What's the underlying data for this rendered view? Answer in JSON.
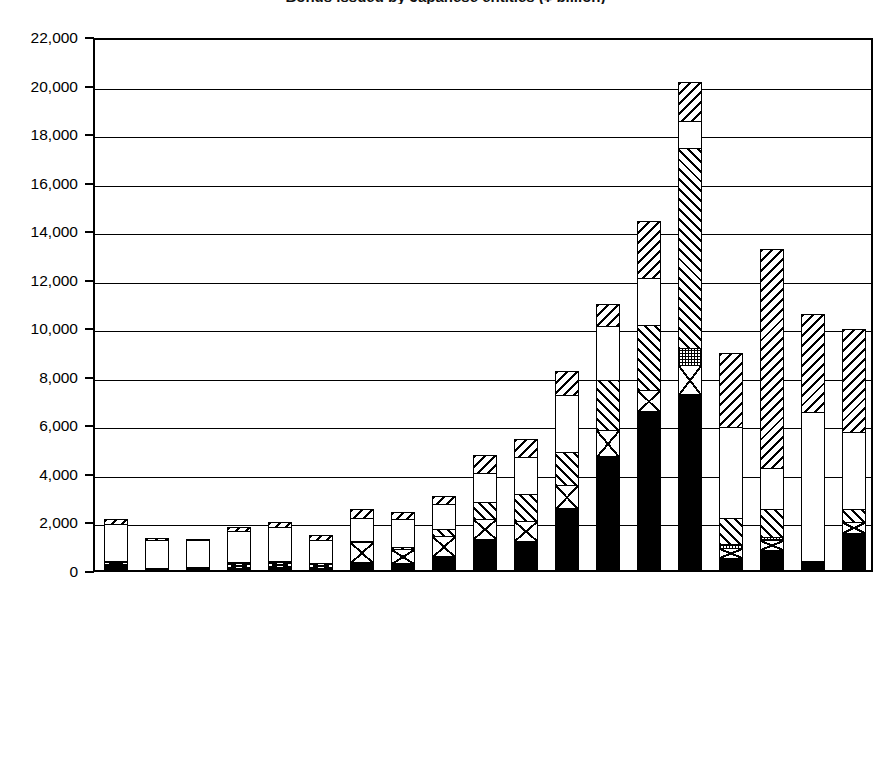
{
  "chart_title": "Bonds issued by Japanese entities (¥ billion)",
  "legend": {
    "left": [
      {
        "key": "straight_foreign",
        "label": "Straight bonds issued in foreign markets",
        "pattern": "p-straight-foreign"
      },
      {
        "key": "straight_domestic",
        "label": "Straight bonds issued in domestic market",
        "pattern": "p-straight-domestic"
      },
      {
        "key": "warrant_foreign",
        "label": "Warrant bonds issued in foreign markets",
        "pattern": "p-warrant-foreign"
      }
    ],
    "right": [
      {
        "key": "warrant_domestic",
        "label": "Warrant bonds issued in domestic market",
        "pattern": "p-warrant-domestic"
      },
      {
        "key": "convertible_foreign",
        "label": "Convertible bonds issued in foreign markets",
        "pattern": "p-convertible-foreign"
      },
      {
        "key": "convertible_domestic",
        "label": "Convertible bonds issued in domestic market",
        "pattern": "p-convertible-domestic"
      }
    ]
  },
  "chart_data": {
    "type": "bar",
    "stacked": true,
    "title": "Bonds issued by Japanese entities (¥ billion)",
    "xlabel": "",
    "ylabel": "",
    "ylim": [
      0,
      22000
    ],
    "ytick_step": 2000,
    "ytick_labels": [
      "0",
      "2,000",
      "4,000",
      "6,000",
      "8,000",
      "10,000",
      "12,000",
      "14,000",
      "16,000",
      "18,000",
      "20,000",
      "22,000"
    ],
    "grid": true,
    "legend_position": "below",
    "categories": [
      "75",
      "76",
      "77",
      "78",
      "79",
      "80",
      "81",
      "82",
      "83",
      "84",
      "85",
      "86",
      "87",
      "88",
      "89",
      "90",
      "91",
      "92",
      "93"
    ],
    "stack_order_bottom_to_top": [
      "convertible_domestic",
      "convertible_foreign",
      "warrant_domestic",
      "warrant_foreign",
      "straight_domestic",
      "straight_foreign"
    ],
    "series": [
      {
        "name": "Convertible bonds issued in domestic market",
        "key": "convertible_domestic",
        "values": [
          300,
          80,
          90,
          150,
          180,
          160,
          380,
          330,
          620,
          1350,
          1250,
          2600,
          4750,
          6600,
          7300,
          560,
          900,
          270,
          1600
        ]
      },
      {
        "name": "Convertible bonds issued in foreign markets",
        "key": "convertible_foreign",
        "values": [
          180,
          130,
          140,
          250,
          280,
          250,
          880,
          670,
          900,
          880,
          900,
          1000,
          1150,
          950,
          1250,
          450,
          450,
          180,
          500
        ]
      },
      {
        "name": "Warrant bonds issued in domestic market",
        "key": "warrant_domestic",
        "values": [
          0,
          0,
          0,
          0,
          0,
          0,
          0,
          0,
          0,
          0,
          0,
          0,
          0,
          0,
          750,
          220,
          180,
          0,
          0
        ]
      },
      {
        "name": "Warrant bonds issued in foreign markets",
        "key": "warrant_foreign",
        "values": [
          0,
          0,
          0,
          40,
          40,
          0,
          100,
          120,
          330,
          750,
          1150,
          1450,
          2100,
          2700,
          8300,
          1150,
          1200,
          100,
          600
        ]
      },
      {
        "name": "Straight bonds issued in domestic market",
        "key": "straight_domestic",
        "values": [
          1600,
          1180,
          1160,
          1350,
          1450,
          1000,
          1000,
          1200,
          1100,
          1250,
          1600,
          2400,
          2300,
          2000,
          1200,
          3800,
          1750,
          6200,
          3200
        ]
      },
      {
        "name": "Straight bonds issued in foreign markets",
        "key": "straight_foreign",
        "values": [
          250,
          150,
          130,
          230,
          270,
          250,
          450,
          350,
          400,
          800,
          800,
          1050,
          950,
          2400,
          1650,
          3100,
          9100,
          4100,
          4300
        ]
      }
    ],
    "totals": [
      2330,
      1540,
      1520,
      2020,
      2220,
      1660,
      2810,
      2670,
      3350,
      5030,
      5700,
      8500,
      11250,
      14650,
      20450,
      9280,
      13580,
      10850,
      10200
    ]
  }
}
